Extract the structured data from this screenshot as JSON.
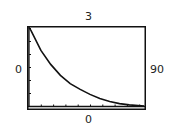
{
  "window": {
    "ymax_label": "3",
    "ymin_label": "0",
    "xmin_label": "0",
    "xmax_label": "90"
  },
  "chart_data": {
    "type": "line",
    "title": "",
    "xlabel": "",
    "ylabel": "",
    "xlim": [
      0,
      90
    ],
    "ylim": [
      0,
      3
    ],
    "grid": false,
    "x_tick_spacing_px": 12.3,
    "series": [
      {
        "name": "exponential decay",
        "x": [
          0,
          1.5,
          9.2,
          16.8,
          24.4,
          32.0,
          39.7,
          47.3,
          54.9,
          62.6,
          70.2,
          77.8,
          89.3
        ],
        "y": [
          3.0,
          2.89,
          2.13,
          1.6,
          1.18,
          0.87,
          0.65,
          0.46,
          0.3,
          0.19,
          0.11,
          0.06,
          0.02
        ]
      }
    ],
    "colors": {
      "curve": "#111111",
      "frame": "#111111",
      "background": "#ffffff"
    }
  }
}
